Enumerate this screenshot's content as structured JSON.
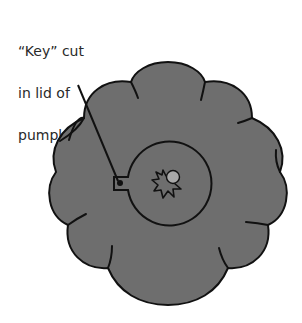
{
  "diagram": {
    "label": {
      "lines": [
        "“Key” cut",
        "in lid of",
        "pumpkin"
      ]
    },
    "colors": {
      "pumpkin_fill": "#6e6e6e",
      "outline": "#111111",
      "stem_circle": "#a8a8a8",
      "background": "#ffffff"
    },
    "elements": [
      "pumpkin-body",
      "lid-circle",
      "key-notch",
      "stem",
      "leader-line"
    ]
  }
}
